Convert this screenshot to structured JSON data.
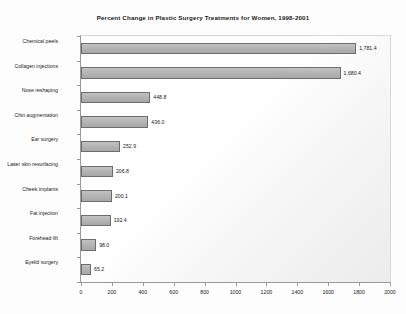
{
  "chart_data": {
    "type": "bar",
    "orientation": "horizontal",
    "title": "Percent Change in Plastic Surgery Treatments for Women, 1998-2001",
    "xlabel": "",
    "ylabel": "",
    "xlim": [
      0,
      2000
    ],
    "grid": false,
    "legend": false,
    "xticks": [
      "0",
      "200",
      "400",
      "600",
      "800",
      "1000",
      "1200",
      "1400",
      "1600",
      "1800",
      "2000"
    ],
    "xtick_values": [
      0,
      200,
      400,
      600,
      800,
      1000,
      1200,
      1400,
      1600,
      1800,
      2000
    ],
    "categories": [
      "Chemical peels",
      "Collagen injections",
      "Nose reshaping",
      "Chin augmentation",
      "Ear surgery",
      "Laser skin resurfacing",
      "Cheek implants",
      "Fat injection",
      "Forehead lift",
      "Eyelid surgery"
    ],
    "values": [
      1781.4,
      1680.4,
      448.8,
      436.0,
      252.9,
      206.8,
      200.1,
      192.4,
      98.0,
      65.2
    ],
    "data_labels": [
      "1,781.4",
      "1,680.4",
      "448.8",
      "436.0",
      "252.9",
      "206.8",
      "200.1",
      "192.4",
      "98.0",
      "65.2"
    ],
    "bar_color": "#b5b5b5",
    "bar_border_color": "#6d6d6d",
    "plot_background": "#ffffff",
    "axis_color": "#9a9a9a"
  }
}
